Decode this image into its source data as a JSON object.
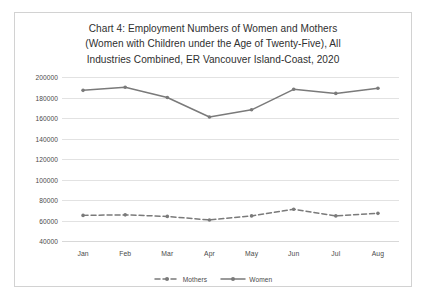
{
  "chart_data": {
    "type": "line",
    "title": "Chart 4: Employment Numbers of Women and Mothers (Women with Children under the Age of Twenty-Five), All Industries Combined, ER Vancouver Island-Coast, 2020",
    "title_lines": [
      "Chart 4: Employment Numbers of Women and Mothers",
      "(Women with Children under the Age of Twenty-Five), All",
      "Industries Combined, ER Vancouver Island-Coast, 2020"
    ],
    "categories": [
      "Jan",
      "Feb",
      "Mar",
      "Apr",
      "May",
      "Jun",
      "Jul",
      "Aug"
    ],
    "series": [
      {
        "name": "Mothers",
        "style": "dashed",
        "color": "#7a7a7a",
        "values": [
          65000,
          65500,
          64000,
          60500,
          64500,
          71000,
          64500,
          67000
        ]
      },
      {
        "name": "Women",
        "style": "solid",
        "color": "#7a7a7a",
        "values": [
          187000,
          190000,
          180000,
          161000,
          168000,
          188000,
          184000,
          189000
        ]
      }
    ],
    "xlabel": "",
    "ylabel": "",
    "ylim": [
      40000,
      200000
    ],
    "ytick_step": 20000,
    "ytick_labels": [
      "200000",
      "180000",
      "160000",
      "140000",
      "120000",
      "100000",
      "80000",
      "60000",
      "40000"
    ],
    "grid": true,
    "legend_position": "bottom"
  },
  "legend": {
    "entries": [
      {
        "label": "Mothers",
        "icon": "dashed-line-marker-icon"
      },
      {
        "label": "Women",
        "icon": "solid-line-marker-icon"
      }
    ]
  },
  "colors": {
    "series_line": "#7a7a7a",
    "gridline": "#e2e2e2",
    "axis": "#d8d8d8",
    "text": "#4a4a4a",
    "title_text": "#2f2f2f",
    "frame_border": "#d2d2d2",
    "background": "#ffffff"
  }
}
